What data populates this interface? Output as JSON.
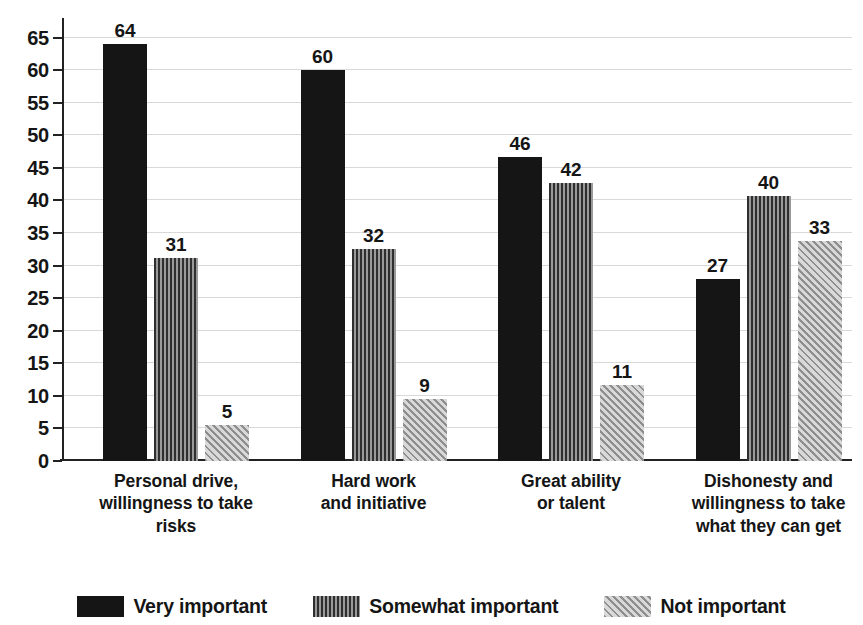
{
  "chart_data": {
    "type": "bar",
    "title": "",
    "subtitle": "",
    "xlabel": "",
    "ylabel": "",
    "ylim": [
      0,
      68
    ],
    "yticks": [
      0,
      5,
      10,
      15,
      20,
      25,
      30,
      35,
      40,
      45,
      50,
      55,
      60,
      65
    ],
    "ytick_labels": [
      "0",
      "5",
      "10",
      "15",
      "20",
      "25",
      "30",
      "35",
      "40",
      "45",
      "50",
      "55",
      "60",
      "65"
    ],
    "grid": true,
    "legend_position": "bottom",
    "categories": [
      "Personal drive,\nwillingness to take risks",
      "Hard work\nand initiative",
      "Great ability\nor talent",
      "Dishonesty and\nwillingness to take\nwhat they can get"
    ],
    "category_lines": [
      [
        "Personal drive,",
        "willingness to take risks"
      ],
      [
        "Hard work",
        "and initiative"
      ],
      [
        "Great ability",
        "or talent"
      ],
      [
        "Dishonesty and",
        "willingness to take",
        "what they can get"
      ]
    ],
    "series": [
      {
        "name": "Very important",
        "pattern": "solid",
        "color": "#151515",
        "values": [
          64,
          60,
          46,
          27
        ],
        "plotted": [
          64,
          60,
          46.6,
          28
        ]
      },
      {
        "name": "Somewhat important",
        "pattern": "vertical-stripes",
        "color": "#6a6a6a",
        "values": [
          31,
          32,
          42,
          40
        ],
        "plotted": [
          31.2,
          32.5,
          42.6,
          40.7
        ]
      },
      {
        "name": "Not important",
        "pattern": "diagonal-hatch",
        "color": "#b4b4b4",
        "values": [
          5,
          9,
          11,
          33
        ],
        "plotted": [
          5.6,
          9.5,
          11.7,
          33.7
        ]
      }
    ]
  },
  "legend": {
    "items": [
      {
        "label": "Very important",
        "swatch": "sw-very"
      },
      {
        "label": "Somewhat important",
        "swatch": "sw-somewhat"
      },
      {
        "label": "Not important",
        "swatch": "sw-not"
      }
    ]
  }
}
